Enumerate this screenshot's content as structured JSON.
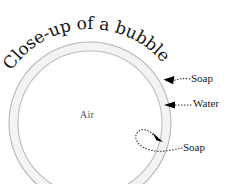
{
  "diagram": {
    "center_label": "Air",
    "labels": {
      "soap_outer": "Soap",
      "water": "Water",
      "soap_inner": "Soap"
    },
    "colors": {
      "background": "#ffffff",
      "shell_stroke": "#b9b9bd",
      "shell_fill": "#f2f2f4",
      "title_text": "#141414",
      "label_text": "#1a1a1a",
      "center_label_text": "#56565a",
      "arrow": "#000000"
    },
    "geometry": {
      "circle_center_x": 90,
      "circle_center_y": 123,
      "outer_radius": 81,
      "inner_radius": 72,
      "title_arc_radius": 101,
      "title_arc_start_deg": 214,
      "title_arc_end_deg": 320
    },
    "annotations": [
      {
        "name": "soap-outer-callout",
        "target": "outer shell",
        "style": "dotted-curved-arrow"
      },
      {
        "name": "water-callout",
        "target": "shell interior",
        "style": "dotted-straight-arrow"
      },
      {
        "name": "soap-inner-callout",
        "target": "inner shell",
        "style": "dotted-loop-arrow"
      }
    ]
  }
}
